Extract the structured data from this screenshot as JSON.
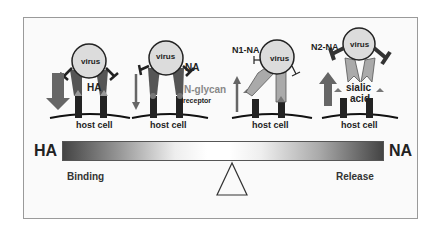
{
  "panels": [
    {
      "host_label": "host cell",
      "virus_label": "virus",
      "protein_label": "HA",
      "arrow": "down-large"
    },
    {
      "host_label": "host cell",
      "virus_label": "virus",
      "protein_label": "NA",
      "receptor_label": "N-glycan",
      "receptor_sub": "receptor",
      "arrow": "down-thin"
    },
    {
      "host_label": "host cell",
      "virus_label": "virus",
      "protein_label": "N1-NA",
      "arrow": "up-thin"
    },
    {
      "host_label": "host cell",
      "virus_label": "virus",
      "protein_label": "N2-NA",
      "receptor_label": "sialic",
      "receptor_sub": "acid",
      "arrow": "up-large"
    }
  ],
  "scale": {
    "left_label": "HA",
    "right_label": "NA",
    "left_caption": "Binding",
    "right_caption": "Release",
    "gradient_colors": [
      "#444444",
      "#ffffff",
      "#444444"
    ]
  }
}
